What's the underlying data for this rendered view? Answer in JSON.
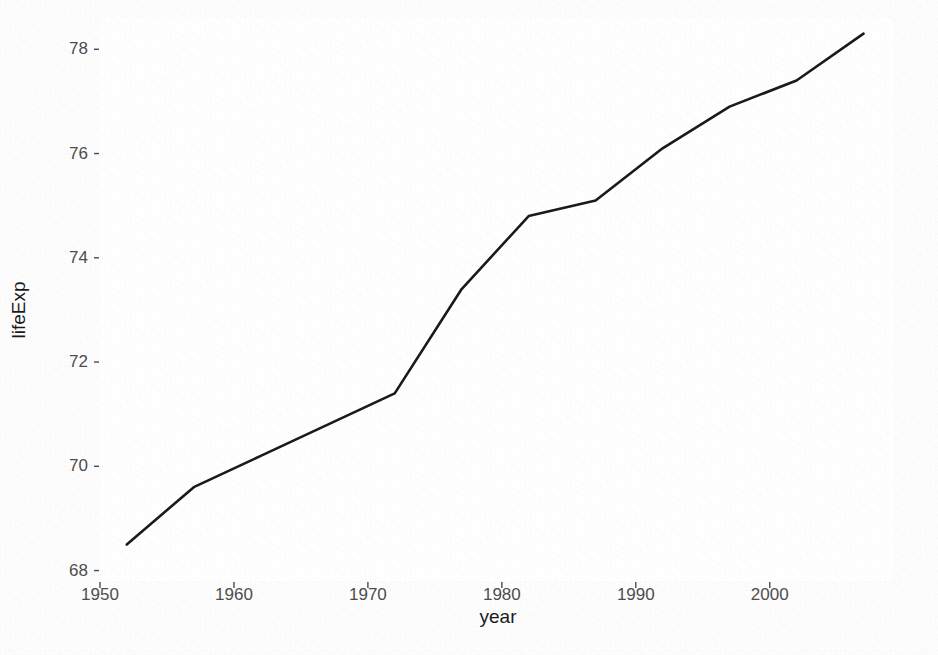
{
  "chart_data": {
    "type": "line",
    "title": "",
    "subtitle": "",
    "xlabel": "year",
    "ylabel": "lifeExp",
    "x": [
      1952,
      1957,
      1962,
      1967,
      1972,
      1977,
      1982,
      1987,
      1992,
      1997,
      2002,
      2007
    ],
    "values": [
      68.5,
      69.6,
      70.2,
      70.8,
      71.4,
      73.4,
      74.8,
      75.1,
      76.1,
      76.9,
      77.4,
      78.3
    ],
    "series": [
      {
        "name": "lifeExp",
        "values": [
          68.5,
          69.6,
          70.2,
          70.8,
          71.4,
          73.4,
          74.8,
          75.1,
          76.1,
          76.9,
          77.4,
          78.3
        ]
      }
    ],
    "xlim": [
      1950.0,
      2009.2
    ],
    "ylim": [
      67.8,
      78.6
    ],
    "xticks": [
      1950,
      1960,
      1970,
      1980,
      1990,
      2000
    ],
    "xtick_labels": [
      "1950",
      "1960",
      "1970",
      "1980",
      "1990",
      "2000"
    ],
    "yticks": [
      68,
      70,
      72,
      74,
      76,
      78
    ],
    "ytick_labels": [
      "68",
      "70",
      "72",
      "74",
      "76",
      "78"
    ],
    "grid": false,
    "legend": null,
    "legend_position": "none",
    "annotations": [],
    "line_color": "#1a1a1a",
    "line_width": 2.6,
    "panel_background": "#ffffff",
    "figure_background": "#fdfdfd",
    "axis_text_color": "#4d4d4d",
    "axis_title_color": "#1a1a1a"
  }
}
